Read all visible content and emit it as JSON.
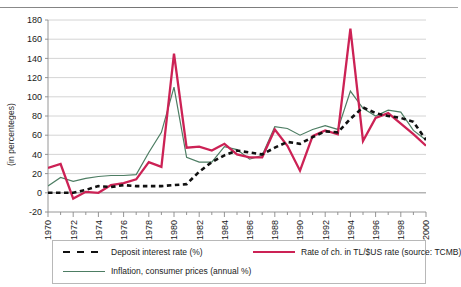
{
  "chart_data": {
    "type": "line",
    "title": "",
    "xlabel": "",
    "ylabel": "(in percenteges)",
    "ylim": [
      -20,
      180
    ],
    "ytick_values": [
      -20,
      0,
      20,
      40,
      60,
      80,
      100,
      120,
      140,
      160,
      180
    ],
    "ytick_labels": [
      "-20",
      "0",
      "20",
      "40",
      "60",
      "80",
      "100",
      "120",
      "140",
      "160",
      "180"
    ],
    "xlim": [
      1970,
      2000
    ],
    "x": [
      1970,
      1971,
      1972,
      1973,
      1974,
      1975,
      1976,
      1977,
      1978,
      1979,
      1980,
      1981,
      1982,
      1983,
      1984,
      1985,
      1986,
      1987,
      1988,
      1989,
      1990,
      1991,
      1992,
      1993,
      1994,
      1995,
      1996,
      1997,
      1998,
      1999,
      2000
    ],
    "xtick_labels": [
      "1970",
      "1972",
      "1974",
      "1976",
      "1978",
      "1980",
      "1982",
      "1984",
      "1986",
      "1988",
      "1990",
      "1992",
      "1994",
      "1996",
      "1998",
      "2000"
    ],
    "xtick_values": [
      1970,
      1972,
      1974,
      1976,
      1978,
      1980,
      1982,
      1984,
      1986,
      1988,
      1990,
      1992,
      1994,
      1996,
      1998,
      2000
    ],
    "grid": "horizontal",
    "legend_position": "below-plot",
    "series": [
      {
        "name": "Deposit interest rate (%)",
        "style": "dashed",
        "color": "#111111",
        "values": [
          0,
          0,
          0,
          3,
          7,
          6,
          8,
          7,
          7,
          7,
          8,
          9,
          22,
          32,
          39,
          44,
          42,
          40,
          47,
          53,
          51,
          58,
          64,
          63,
          77,
          89,
          83,
          80,
          78,
          74,
          55
        ]
      },
      {
        "name": "Inflation, consumer prices (annual %)",
        "style": "solid",
        "color": "#4d7d63",
        "values": [
          7,
          16,
          12,
          15,
          17,
          18,
          18,
          19,
          42,
          63,
          110,
          37,
          32,
          32,
          48,
          45,
          35,
          39,
          69,
          67,
          60,
          66,
          70,
          66,
          106,
          88,
          80,
          86,
          84,
          65,
          55
        ]
      },
      {
        "name": "Rate of ch. in TL/$US rate (source: TCMB)",
        "style": "solid",
        "color": "#cc2255",
        "values": [
          26,
          30,
          -6,
          1,
          0,
          8,
          10,
          14,
          32,
          27,
          145,
          47,
          48,
          44,
          51,
          40,
          37,
          37,
          66,
          49,
          23,
          59,
          65,
          61,
          171,
          54,
          78,
          83,
          72,
          61,
          49
        ]
      }
    ]
  },
  "legend": {
    "items": [
      {
        "label": "Deposit interest rate (%)",
        "swatch": "dashed"
      },
      {
        "label": "Rate of ch. in TL/$US rate (source: TCMB)",
        "swatch": "solid-red"
      },
      {
        "label": "Inflation, consumer prices (annual %)",
        "swatch": "solid-green"
      }
    ]
  }
}
